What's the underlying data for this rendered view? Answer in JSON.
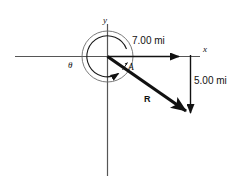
{
  "figure": {
    "background_color": "#ffffff",
    "line_color": "#4d4d4d",
    "vector_color": "#111111",
    "axes": {
      "x_label": "x",
      "y_label": "y"
    },
    "angle": {
      "symbol": "θ",
      "arc_direction": "counter-clockwise"
    },
    "vectors": [
      {
        "name": "A",
        "label": "A",
        "notation": "arrow-over-letter"
      },
      {
        "name": "R",
        "label": "R",
        "notation": "bold"
      }
    ],
    "dimensions": [
      {
        "name": "horizontal-component",
        "value": "7.00 mi",
        "orientation": "horizontal"
      },
      {
        "name": "vertical-component",
        "value": "5.00 mi",
        "orientation": "vertical"
      }
    ]
  }
}
